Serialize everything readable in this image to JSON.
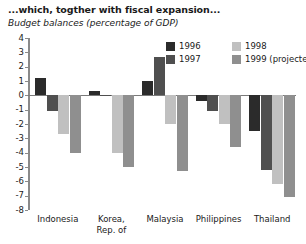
{
  "header": {
    "title": "...which, togther with fiscal expansion...",
    "subtitle": "Budget balances (percentage of GDP)"
  },
  "legend": {
    "position": "top-right",
    "entries": [
      {
        "label": "1996",
        "color": "#2b2b2b"
      },
      {
        "label": "1997",
        "color": "#4f4f4f"
      },
      {
        "label": "1998",
        "color": "#c0c0c0"
      },
      {
        "label": "1999  (projected)",
        "color": "#8f8f8f"
      }
    ]
  },
  "chart_data": {
    "type": "bar",
    "title": "...which, togther with fiscal expansion...",
    "subtitle": "Budget balances (percentage of GDP)",
    "xlabel": "",
    "ylabel": "",
    "ylim": [
      -8,
      4
    ],
    "yticks": [
      4,
      3,
      2,
      1,
      0,
      -1,
      -2,
      -3,
      -4,
      -5,
      -6,
      -7,
      -8
    ],
    "ytick_labels": [
      "4",
      "3",
      "2",
      "1",
      "0",
      "-1",
      "-2",
      "-3",
      "-4",
      "-5",
      "-6",
      "-7",
      "-8"
    ],
    "grid": false,
    "categories": [
      "Indonesia",
      "Korea, Rep. of",
      "Malaysia",
      "Philippines",
      "Thailand"
    ],
    "category_lines": [
      [
        "Indonesia"
      ],
      [
        "Korea,",
        "Rep. of"
      ],
      [
        "Malaysia"
      ],
      [
        "Philippines"
      ],
      [
        "Thailand"
      ]
    ],
    "series": [
      {
        "name": "1996",
        "color": "#2b2b2b",
        "values": [
          1.2,
          0.3,
          1.0,
          -0.4,
          -2.5
        ]
      },
      {
        "name": "1997",
        "color": "#4f4f4f",
        "values": [
          -1.1,
          0.0,
          2.7,
          -1.1,
          -5.2
        ]
      },
      {
        "name": "1998",
        "color": "#c0c0c0",
        "values": [
          -2.7,
          -4.0,
          -2.0,
          -2.0,
          -6.2
        ]
      },
      {
        "name": "1999 (projected)",
        "color": "#8f8f8f",
        "values": [
          -4.0,
          -5.0,
          -5.3,
          -3.6,
          -7.1
        ]
      }
    ]
  }
}
